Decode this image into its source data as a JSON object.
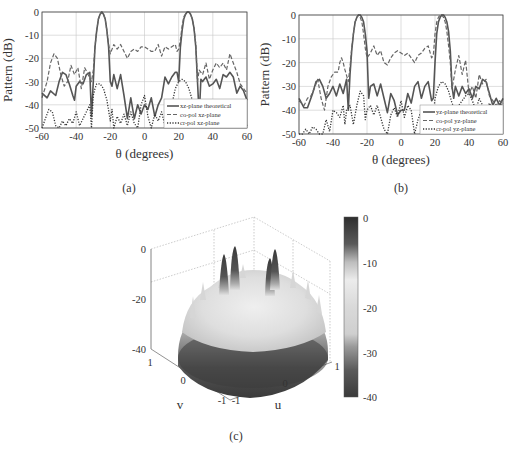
{
  "chart_data": [
    {
      "id": "a",
      "type": "line",
      "caption": "(a)",
      "xlabel": "θ (degrees)",
      "ylabel": "Pattern (dB)",
      "xlim": [
        -60,
        60
      ],
      "ylim": [
        -50,
        0
      ],
      "xticks": [
        -60,
        -40,
        -20,
        0,
        20,
        40,
        60
      ],
      "yticks": [
        0,
        -10,
        -20,
        -30,
        -40,
        -50
      ],
      "grid": true,
      "legend_position": "lower right",
      "series": [
        {
          "name": "xz-plane theoretical",
          "style": "solid",
          "x": [
            -60,
            -57,
            -55,
            -52,
            -50,
            -48,
            -46,
            -44,
            -42,
            -41,
            -40,
            -38,
            -36,
            -34,
            -32,
            -31,
            -30,
            -29,
            -28,
            -27,
            -26,
            -25,
            -24,
            -23,
            -22,
            -21,
            -20,
            -19,
            -18,
            -16,
            -14,
            -12,
            -10,
            -8,
            -6,
            -4,
            -2,
            0,
            2,
            4,
            6,
            8,
            10,
            12,
            14,
            16,
            18,
            19,
            20,
            21,
            22,
            23,
            24,
            25,
            26,
            27,
            28,
            29,
            30,
            31,
            32,
            33,
            34,
            36,
            38,
            40,
            42,
            44,
            46,
            48,
            50,
            52,
            54,
            56,
            58,
            60
          ],
          "y": [
            -35,
            -37,
            -34,
            -36,
            -30,
            -26,
            -27,
            -31,
            -36,
            -38,
            -32,
            -30,
            -31,
            -27,
            -26,
            -45,
            -30,
            -15,
            -8,
            -3,
            -1,
            0,
            -1,
            -3,
            -8,
            -15,
            -30,
            -32,
            -27,
            -33,
            -27,
            -36,
            -46,
            -37,
            -46,
            -40,
            -44,
            -40,
            -42,
            -37,
            -45,
            -40,
            -37,
            -28,
            -31,
            -28,
            -26,
            -26,
            -30,
            -15,
            -8,
            -3,
            -1,
            0,
            0,
            -1,
            -3,
            -7,
            -15,
            -30,
            -45,
            -29,
            -30,
            -28,
            -32,
            -31,
            -29,
            -33,
            -27,
            -28,
            -26,
            -28,
            -35,
            -32,
            -34,
            -38
          ]
        },
        {
          "name": "co-pol xz-plane",
          "style": "dashed",
          "x": [
            -60,
            -57,
            -55,
            -53,
            -51,
            -49,
            -47,
            -45,
            -43,
            -41,
            -39,
            -37,
            -35,
            -33,
            -31,
            -30,
            -29,
            -28,
            -27,
            -26,
            -25,
            -24,
            -23,
            -22,
            -21,
            -20,
            -18,
            -16,
            -14,
            -12,
            -10,
            -8,
            -6,
            -4,
            -2,
            0,
            2,
            4,
            6,
            8,
            10,
            12,
            14,
            16,
            18,
            19,
            20,
            21,
            22,
            23,
            24,
            25,
            26,
            27,
            28,
            29,
            30,
            31,
            32,
            33,
            34,
            36,
            38,
            40,
            42,
            44,
            46,
            48,
            50,
            52,
            54,
            56,
            58,
            60
          ],
          "y": [
            -37,
            -30,
            -22,
            -18,
            -20,
            -27,
            -32,
            -30,
            -23,
            -27,
            -24,
            -33,
            -24,
            -27,
            -30,
            -25,
            -15,
            -8,
            -3,
            -1,
            0,
            -1,
            -3,
            -8,
            -14,
            -18,
            -14,
            -16,
            -14,
            -17,
            -20,
            -17,
            -16,
            -17,
            -15,
            -15,
            -16,
            -17,
            -17,
            -14,
            -19,
            -15,
            -16,
            -15,
            -14,
            -17,
            -16,
            -12,
            -6,
            -2,
            -1,
            0,
            0,
            -1,
            -3,
            -7,
            -14,
            -30,
            -25,
            -26,
            -27,
            -22,
            -29,
            -25,
            -22,
            -24,
            -22,
            -25,
            -18,
            -22,
            -26,
            -31,
            -33,
            -35
          ]
        },
        {
          "name": "cr-pol xz-plane",
          "style": "dotted",
          "x": [
            -60,
            -58,
            -56,
            -54,
            -52,
            -50,
            -48,
            -46,
            -44,
            -42,
            -40,
            -38,
            -36,
            -34,
            -32,
            -31,
            -30,
            -29,
            -28,
            -26,
            -24,
            -22,
            -20,
            -19,
            -18,
            -16,
            -14,
            -12,
            -10,
            -8,
            -6,
            -4,
            -2,
            0,
            2,
            4,
            6,
            8,
            10,
            12,
            14,
            16,
            18,
            20,
            22,
            24,
            26,
            28,
            30,
            31,
            32,
            34,
            36,
            38,
            40,
            42,
            44,
            46,
            48,
            50,
            52,
            54,
            56,
            58,
            60
          ],
          "y": [
            -50,
            -46,
            -42,
            -43,
            -49,
            -50,
            -47,
            -49,
            -46,
            -48,
            -43,
            -49,
            -46,
            -43,
            -40,
            -50,
            -36,
            -33,
            -31,
            -31,
            -33,
            -38,
            -47,
            -42,
            -50,
            -45,
            -48,
            -44,
            -49,
            -43,
            -48,
            -50,
            -40,
            -36,
            -45,
            -50,
            -44,
            -47,
            -43,
            -49,
            -46,
            -40,
            -33,
            -30,
            -29,
            -30,
            -33,
            -38,
            -48,
            -50,
            -40,
            -42,
            -44,
            -38,
            -42,
            -45,
            -43,
            -46,
            -50,
            -44,
            -47,
            -45,
            -50,
            -46,
            -49
          ]
        }
      ]
    },
    {
      "id": "b",
      "type": "line",
      "caption": "(b)",
      "xlabel": "θ (degrees)",
      "ylabel": "Pattern (dB)",
      "xlim": [
        -60,
        60
      ],
      "ylim": [
        -50,
        0
      ],
      "xticks": [
        -60,
        -40,
        -20,
        0,
        20,
        40,
        60
      ],
      "yticks": [
        0,
        -10,
        -20,
        -30,
        -40,
        -50
      ],
      "grid": true,
      "legend_position": "lower right",
      "series": [
        {
          "name": "yz-plane theoretical",
          "style": "solid",
          "x": [
            -60,
            -57,
            -55,
            -52,
            -50,
            -48,
            -46,
            -44,
            -42,
            -40,
            -38,
            -36,
            -34,
            -32,
            -31,
            -30,
            -29,
            -28,
            -27,
            -26,
            -25,
            -24,
            -23,
            -22,
            -21,
            -20,
            -19,
            -18,
            -16,
            -14,
            -12,
            -10,
            -8,
            -6,
            -4,
            -2,
            0,
            2,
            4,
            6,
            8,
            10,
            12,
            14,
            16,
            18,
            19,
            20,
            21,
            22,
            23,
            24,
            25,
            26,
            27,
            28,
            29,
            30,
            31,
            32,
            34,
            36,
            38,
            40,
            42,
            44,
            46,
            48,
            50,
            52,
            54,
            56,
            58,
            60
          ],
          "y": [
            -35,
            -39,
            -39,
            -33,
            -28,
            -27,
            -30,
            -35,
            -33,
            -30,
            -34,
            -29,
            -33,
            -27,
            -40,
            -25,
            -15,
            -8,
            -3,
            -1,
            0,
            0,
            -1,
            -3,
            -8,
            -15,
            -35,
            -30,
            -29,
            -34,
            -29,
            -35,
            -41,
            -33,
            -36,
            -42,
            -40,
            -40,
            -33,
            -37,
            -30,
            -28,
            -35,
            -30,
            -28,
            -36,
            -35,
            -20,
            -8,
            -3,
            -1,
            0,
            0,
            -1,
            -3,
            -7,
            -15,
            -30,
            -35,
            -30,
            -34,
            -30,
            -33,
            -31,
            -35,
            -30,
            -31,
            -27,
            -28,
            -33,
            -38,
            -35,
            -38,
            -35
          ]
        },
        {
          "name": "co-pol yz-plane",
          "style": "dashed",
          "x": [
            -60,
            -57,
            -55,
            -53,
            -51,
            -49,
            -47,
            -45,
            -43,
            -41,
            -39,
            -37,
            -36,
            -35,
            -34,
            -33,
            -31,
            -30,
            -29,
            -28,
            -27,
            -26,
            -25,
            -24,
            -23,
            -22,
            -21,
            -20,
            -18,
            -16,
            -14,
            -12,
            -10,
            -8,
            -6,
            -4,
            -2,
            0,
            2,
            4,
            6,
            8,
            10,
            12,
            14,
            16,
            18,
            19,
            20,
            21,
            22,
            23,
            24,
            25,
            26,
            27,
            28,
            29,
            30,
            32,
            34,
            36,
            38,
            40,
            42,
            44,
            46,
            48,
            50,
            52,
            54,
            56,
            58,
            60
          ],
          "y": [
            -36,
            -38,
            -35,
            -34,
            -31,
            -27,
            -35,
            -40,
            -30,
            -26,
            -24,
            -24,
            -20,
            -18,
            -20,
            -23,
            -28,
            -22,
            -14,
            -8,
            -3,
            -1,
            0,
            -1,
            -3,
            -8,
            -14,
            -18,
            -16,
            -13,
            -17,
            -15,
            -20,
            -21,
            -18,
            -16,
            -15,
            -16,
            -17,
            -16,
            -18,
            -20,
            -17,
            -16,
            -14,
            -13,
            -18,
            -17,
            -8,
            -3,
            -1,
            0,
            0,
            -1,
            -3,
            -7,
            -13,
            -20,
            -31,
            -23,
            -17,
            -25,
            -19,
            -33,
            -30,
            -35,
            -25,
            -29,
            -27,
            -34,
            -36,
            -38,
            -36,
            -37
          ]
        },
        {
          "name": "cr-pol yz-plane",
          "style": "dotted",
          "x": [
            -60,
            -58,
            -56,
            -54,
            -52,
            -50,
            -48,
            -46,
            -44,
            -42,
            -40,
            -38,
            -36,
            -34,
            -33,
            -32,
            -30,
            -28,
            -26,
            -24,
            -22,
            -21,
            -20,
            -18,
            -16,
            -14,
            -12,
            -10,
            -8,
            -6,
            -4,
            -2,
            0,
            2,
            4,
            6,
            8,
            10,
            12,
            14,
            16,
            18,
            20,
            22,
            24,
            26,
            28,
            30,
            32,
            34,
            36,
            38,
            40,
            42,
            44,
            46,
            48,
            50,
            52,
            54,
            56,
            58,
            60
          ],
          "y": [
            -50,
            -50,
            -48,
            -50,
            -47,
            -48,
            -50,
            -50,
            -44,
            -49,
            -40,
            -41,
            -43,
            -38,
            -46,
            -40,
            -38,
            -46,
            -38,
            -32,
            -34,
            -44,
            -40,
            -38,
            -42,
            -38,
            -43,
            -48,
            -50,
            -42,
            -39,
            -43,
            -36,
            -43,
            -38,
            -40,
            -50,
            -44,
            -40,
            -45,
            -44,
            -50,
            -35,
            -30,
            -28,
            -29,
            -32,
            -37,
            -40,
            -38,
            -36,
            -34,
            -33,
            -36,
            -40,
            -35,
            -38,
            -41,
            -37,
            -40,
            -39,
            -38,
            -37
          ]
        }
      ]
    },
    {
      "id": "c",
      "type": "surface3d",
      "caption": "(c)",
      "xlabel": "u",
      "ylabel": "v",
      "zlabel": "",
      "xlim": [
        -1,
        1
      ],
      "ylim": [
        -1,
        1
      ],
      "zlim": [
        -40,
        0
      ],
      "xticks": [
        -1,
        0,
        1
      ],
      "yticks": [
        -1,
        0,
        1
      ],
      "zticks": [
        0,
        -20,
        -40
      ],
      "colorbar": {
        "ticks": [
          0,
          -10,
          -20,
          -30,
          -40
        ],
        "range": [
          -40,
          0
        ],
        "colormap": "gray-diverging"
      },
      "description": "Four beam peaks reaching 0 dB above a disc-shaped sidelobe floor around -15 to -25 dB, falling to -40 dB at the unit circle edge"
    }
  ],
  "labels": {
    "a": {
      "caption": "(a)",
      "xlabel": "θ (degrees)",
      "ylabel": "Pattern (dB)",
      "legend": [
        "xz-plane theoretical",
        "co-pol xz-plane",
        "cr-pol xz-plane"
      ]
    },
    "b": {
      "caption": "(b)",
      "xlabel": "θ (degrees)",
      "ylabel": "Pattern (dB)",
      "legend": [
        "yz-plane theoretical",
        "co-pol yz-plane",
        "cr-pol yz-plane"
      ]
    },
    "c": {
      "caption": "(c)",
      "ulabel": "u",
      "vlabel": "v",
      "zticks": [
        "0",
        "-20",
        "-40"
      ],
      "uticks": [
        "-1",
        "0",
        "1"
      ],
      "vticks": [
        "1",
        "0",
        "-1"
      ],
      "cbticks": [
        "0",
        "-10",
        "-20",
        "-30",
        "-40"
      ]
    }
  }
}
